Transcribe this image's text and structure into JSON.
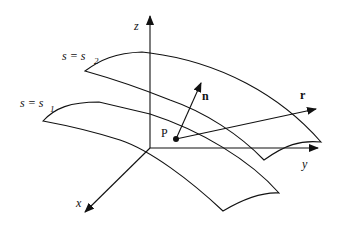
{
  "diagram": {
    "axes": {
      "x": {
        "label": "x"
      },
      "y": {
        "label": "y"
      },
      "z": {
        "label": "z"
      }
    },
    "surfaces": [
      {
        "id": "s2",
        "label_lhs": "s = s",
        "subscript": "2"
      },
      {
        "id": "s1",
        "label_lhs": "s = s",
        "subscript": "1"
      }
    ],
    "point": {
      "label": "P"
    },
    "vectors": {
      "normal": {
        "label": "n"
      },
      "position": {
        "label": "r"
      }
    },
    "colors": {
      "stroke": "#111111",
      "background": "#ffffff"
    }
  }
}
